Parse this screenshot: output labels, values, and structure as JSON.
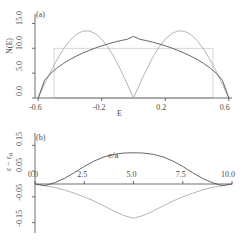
{
  "figure": {
    "background": "#ffffff",
    "ink": "#4a4a4a",
    "curve_dark": "#555555",
    "curve_light": "#aaaaaa",
    "box_color": "#cccccc"
  },
  "panel_a": {
    "tag": "(a)",
    "ylabel": "N(E)",
    "xlabel": "E",
    "yticks": [
      "0.0",
      "5.0",
      "10.0",
      "15.0"
    ],
    "ytick_values": [
      0,
      5,
      10,
      15
    ],
    "xticks": [
      "-0.6",
      "-0.2",
      "0.2",
      "0.6"
    ],
    "xtick_values": [
      -0.6,
      -0.2,
      0.2,
      0.6
    ]
  },
  "panel_b": {
    "tag": "(b)",
    "ylabel": "ε − ε₀",
    "xlabel": "e/a",
    "yticks": [
      "0.15",
      "0.05",
      "-0.05",
      "-0.15"
    ],
    "ytick_values": [
      0.15,
      0.05,
      -0.05,
      -0.15
    ],
    "xticks": [
      "0.0",
      "2.5",
      "5.0",
      "7.5",
      "10.0"
    ],
    "xtick_values": [
      0.0,
      2.5,
      5.0,
      7.5,
      10.0
    ]
  },
  "chart_data": [
    {
      "type": "line",
      "panel": "(a)",
      "title": "",
      "xlabel": "E",
      "ylabel": "N(E)",
      "xlim": [
        -0.62,
        0.62
      ],
      "ylim": [
        0,
        16.5
      ],
      "grid": false,
      "legend": null,
      "series": [
        {
          "name": "free-electron semi-elliptic DOS",
          "style": "solid-dark",
          "x": [
            -0.6,
            -0.56,
            -0.52,
            -0.48,
            -0.44,
            -0.4,
            -0.36,
            -0.32,
            -0.28,
            -0.24,
            -0.2,
            -0.16,
            -0.12,
            -0.08,
            -0.04,
            0.0,
            0.04,
            0.08,
            0.12,
            0.16,
            0.2,
            0.24,
            0.28,
            0.32,
            0.36,
            0.4,
            0.44,
            0.48,
            0.52,
            0.56,
            0.6
          ],
          "y": [
            0.0,
            3.55,
            5.0,
            6.09,
            6.98,
            7.75,
            8.43,
            9.03,
            9.57,
            10.06,
            10.5,
            10.89,
            11.24,
            11.55,
            11.81,
            12.4,
            11.81,
            11.55,
            11.24,
            10.89,
            10.5,
            10.06,
            9.57,
            9.03,
            8.43,
            7.75,
            6.98,
            6.09,
            5.0,
            3.55,
            0.0
          ]
        },
        {
          "name": "pseudogap DOS (two-peak)",
          "style": "solid-light",
          "x": [
            -0.6,
            -0.56,
            -0.52,
            -0.48,
            -0.44,
            -0.4,
            -0.36,
            -0.32,
            -0.28,
            -0.24,
            -0.2,
            -0.16,
            -0.12,
            -0.08,
            -0.04,
            0.0,
            0.04,
            0.08,
            0.12,
            0.16,
            0.2,
            0.24,
            0.28,
            0.32,
            0.36,
            0.4,
            0.44,
            0.48,
            0.52,
            0.56,
            0.6
          ],
          "y": [
            0.0,
            2.8,
            5.4,
            7.8,
            9.9,
            11.6,
            12.8,
            13.45,
            13.5,
            12.95,
            11.85,
            10.2,
            8.1,
            5.6,
            2.85,
            0.0,
            2.85,
            5.6,
            8.1,
            10.2,
            11.85,
            12.95,
            13.5,
            13.45,
            12.8,
            11.6,
            9.9,
            7.8,
            5.4,
            2.8,
            0.0
          ]
        },
        {
          "name": "rectangular (constant) DOS band",
          "style": "box",
          "x": [
            -0.5,
            0.5
          ],
          "y": [
            10.0,
            10.0
          ]
        }
      ]
    },
    {
      "type": "line",
      "panel": "(b)",
      "title": "",
      "xlabel": "e/a",
      "ylabel": "ε − ε₀",
      "xlim": [
        0.0,
        10.0
      ],
      "ylim": [
        -0.19,
        0.19
      ],
      "grid": false,
      "legend": null,
      "series": [
        {
          "name": "positive energy shift",
          "style": "solid-dark",
          "x": [
            0.0,
            0.5,
            1.0,
            1.5,
            2.0,
            2.5,
            3.0,
            3.5,
            4.0,
            4.5,
            5.0,
            5.5,
            6.0,
            6.5,
            7.0,
            7.5,
            8.0,
            8.5,
            9.0,
            9.5,
            10.0
          ],
          "y": [
            0.0,
            -0.006,
            0.005,
            0.022,
            0.044,
            0.068,
            0.089,
            0.105,
            0.115,
            0.12,
            0.121,
            0.12,
            0.115,
            0.105,
            0.089,
            0.068,
            0.044,
            0.022,
            0.005,
            -0.006,
            0.0
          ]
        },
        {
          "name": "negative energy shift",
          "style": "solid-light",
          "x": [
            0.0,
            0.5,
            1.0,
            1.5,
            2.0,
            2.5,
            3.0,
            3.5,
            4.0,
            4.5,
            5.0,
            5.5,
            6.0,
            6.5,
            7.0,
            7.5,
            8.0,
            8.5,
            9.0,
            9.5,
            10.0
          ],
          "y": [
            0.0,
            -0.007,
            -0.013,
            -0.023,
            -0.036,
            -0.05,
            -0.066,
            -0.085,
            -0.105,
            -0.122,
            -0.133,
            -0.122,
            -0.105,
            -0.085,
            -0.066,
            -0.05,
            -0.036,
            -0.023,
            -0.013,
            -0.007,
            0.0
          ]
        }
      ]
    }
  ]
}
